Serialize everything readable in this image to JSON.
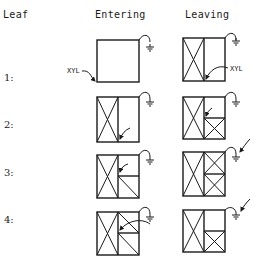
{
  "headers": {
    "leaf": "Leaf",
    "entering": "Entering",
    "leaving": "Leaving"
  },
  "rows": [
    {
      "label": "1:"
    },
    {
      "label": "2:"
    },
    {
      "label": "3:"
    },
    {
      "label": "4:"
    }
  ],
  "annotations": {
    "xyl_entering": "XYL",
    "xyl_leaving": "XYL"
  },
  "icons": {
    "ground": "ground-symbol",
    "arrow": "curved-arrow"
  }
}
